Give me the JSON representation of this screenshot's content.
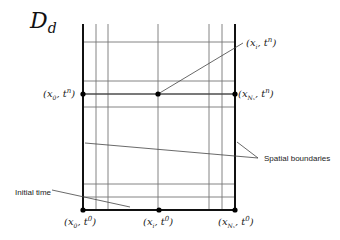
{
  "title": {
    "main": "D",
    "sub": "d"
  },
  "grid": {
    "x_left": 83,
    "x_right": 235,
    "y_top": 24,
    "y_bottom": 210,
    "inner_vertical_x": [
      96,
      108,
      158,
      209,
      222
    ],
    "horizontal_y": [
      42,
      81,
      94,
      107,
      184,
      197
    ],
    "line_color": "#777777",
    "boundary_color": "#111111"
  },
  "points": [
    {
      "name": "x0-tn",
      "x": 83,
      "y": 94
    },
    {
      "name": "xi-tn",
      "x": 158,
      "y": 94
    },
    {
      "name": "xNx-tn",
      "x": 235,
      "y": 94
    },
    {
      "name": "x0-t0",
      "x": 83,
      "y": 210
    },
    {
      "name": "xi-t0",
      "x": 159,
      "y": 210
    },
    {
      "name": "xNx-t0",
      "x": 235,
      "y": 210
    }
  ],
  "labels": {
    "xi_tn": {
      "x": "x",
      "sub": "i",
      "t": "t",
      "sup": "n"
    },
    "x0_tn": {
      "x": "x",
      "sub": "0",
      "t": "t",
      "sup": "n"
    },
    "xNx_tn": {
      "x": "x",
      "sub": "Nₓ",
      "t": "t",
      "sup": "n"
    },
    "x0_t0": {
      "x": "x",
      "sub": "0",
      "t": "t",
      "sup": "0"
    },
    "xi_t0": {
      "x": "x",
      "sub": "i",
      "t": "t",
      "sup": "0"
    },
    "xNx_t0": {
      "x": "x",
      "sub": "Nₓ",
      "t": "t",
      "sup": "0"
    }
  },
  "annotations": {
    "spatial_boundaries": "Spatial boundaries",
    "initial_time": "Initial time"
  }
}
